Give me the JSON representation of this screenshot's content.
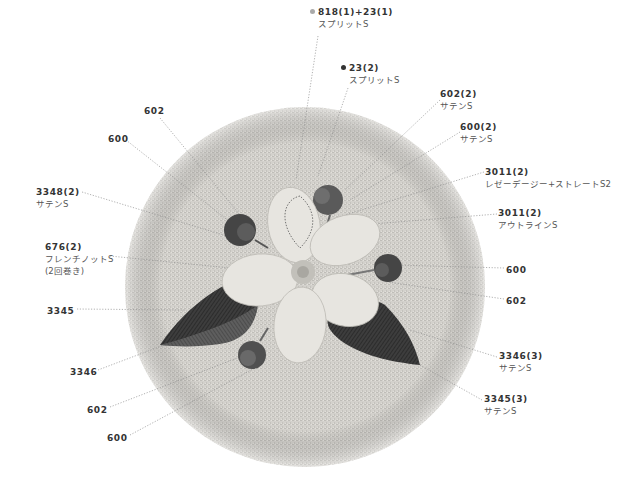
{
  "diagram": {
    "colors": {
      "fabric": "#cfcdc8",
      "petal": "#e6e4df",
      "leaf_dark": "#3a3a3a",
      "leaf_light": "#5e5e5e",
      "bud_dark": "#4a4a4a",
      "bud_mid": "#6e6e6e",
      "center": "#bdbbb5",
      "leader_line": "#9a9a9a",
      "dot_818": "#aaaaaa",
      "dot_23": "#333333"
    },
    "labels": [
      {
        "id": "l1",
        "code": "818(1)+23(1)",
        "stitch": "スプリットS",
        "dot": "light",
        "x": 310,
        "y": 6
      },
      {
        "id": "l2",
        "code": "23(2)",
        "stitch": "スプリットS",
        "dot": "dark",
        "x": 341,
        "y": 62
      },
      {
        "id": "l3",
        "code": "602(2)",
        "stitch": "サテンS",
        "x": 440,
        "y": 88
      },
      {
        "id": "l4",
        "code": "600(2)",
        "stitch": "サテンS",
        "x": 460,
        "y": 121
      },
      {
        "id": "l5",
        "code": "3011(2)",
        "stitch": "レゼーデージー+ストレートS2",
        "x": 485,
        "y": 166
      },
      {
        "id": "l6",
        "code": "3011(2)",
        "stitch": "アウトラインS",
        "x": 498,
        "y": 207
      },
      {
        "id": "l7",
        "code": "600",
        "stitch": "",
        "x": 506,
        "y": 264
      },
      {
        "id": "l8",
        "code": "602",
        "stitch": "",
        "x": 506,
        "y": 295
      },
      {
        "id": "l9",
        "code": "3346(3)",
        "stitch": "サテンS",
        "x": 499,
        "y": 350
      },
      {
        "id": "l10",
        "code": "3345(3)",
        "stitch": "サテンS",
        "x": 484,
        "y": 393
      },
      {
        "id": "l11",
        "code": "602",
        "stitch": "",
        "x": 144,
        "y": 105
      },
      {
        "id": "l12",
        "code": "600",
        "stitch": "",
        "x": 108,
        "y": 133
      },
      {
        "id": "l13",
        "code": "3348(2)",
        "stitch": "サテンS",
        "x": 36,
        "y": 186
      },
      {
        "id": "l14",
        "code": "676(2)",
        "stitch": "フレンチノットS",
        "note": "(2回巻き)",
        "x": 45,
        "y": 241
      },
      {
        "id": "l15",
        "code": "3345",
        "stitch": "",
        "x": 47,
        "y": 305
      },
      {
        "id": "l16",
        "code": "3346",
        "stitch": "",
        "x": 70,
        "y": 366
      },
      {
        "id": "l17",
        "code": "602",
        "stitch": "",
        "x": 87,
        "y": 404
      },
      {
        "id": "l18",
        "code": "600",
        "stitch": "",
        "x": 107,
        "y": 432
      }
    ]
  }
}
